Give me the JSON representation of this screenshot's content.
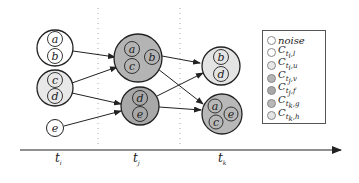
{
  "diagram": {
    "type": "cluster-evolution-timeline",
    "colors": {
      "noise": "#ffffff",
      "C_ti_l": "#ffffff",
      "C_ti_u": "#e8e8e8",
      "C_tj_v": "#b4b4b4",
      "C_tj_f": "#a8a8a8",
      "C_tk_g": "#b8b8b8",
      "C_tk_h": "#e4e4e4",
      "stroke": "#222222",
      "divider": "#aaaaaa"
    },
    "timeline": {
      "labels": [
        {
          "main": "t",
          "sub": "i"
        },
        {
          "main": "t",
          "sub": "j"
        },
        {
          "main": "t",
          "sub": "k"
        }
      ]
    },
    "clusters": [
      {
        "id": "ti-ab",
        "time": "t_i",
        "members": [
          "a",
          "b"
        ],
        "legend": "C_ti_l"
      },
      {
        "id": "ti-cd",
        "time": "t_i",
        "members": [
          "c",
          "d"
        ],
        "legend": "C_ti_u"
      },
      {
        "id": "ti-e",
        "time": "t_i",
        "members": [
          "e"
        ],
        "legend": "noise"
      },
      {
        "id": "tj-abc",
        "time": "t_j",
        "members": [
          "a",
          "b",
          "c"
        ],
        "legend": "C_tj_v"
      },
      {
        "id": "tj-de",
        "time": "t_j",
        "members": [
          "d",
          "e"
        ],
        "legend": "C_tj_f"
      },
      {
        "id": "tk-bd",
        "time": "t_k",
        "members": [
          "b",
          "d"
        ],
        "legend": "C_tk_h"
      },
      {
        "id": "tk-ace",
        "time": "t_k",
        "members": [
          "a",
          "c",
          "e"
        ],
        "legend": "C_tk_g"
      }
    ],
    "edges": [
      {
        "from": "ti-ab",
        "to": "tj-abc"
      },
      {
        "from": "ti-cd",
        "to": "tj-abc"
      },
      {
        "from": "ti-cd",
        "to": "tj-de"
      },
      {
        "from": "ti-e",
        "to": "tj-de"
      },
      {
        "from": "tj-abc",
        "to": "tk-bd"
      },
      {
        "from": "tj-abc",
        "to": "tk-ace"
      },
      {
        "from": "tj-de",
        "to": "tk-bd"
      },
      {
        "from": "tj-de",
        "to": "tk-ace"
      }
    ],
    "legend": {
      "items": [
        {
          "key": "noise",
          "main": "noise",
          "sub": "",
          "sub2": "",
          "color": "#ffffff"
        },
        {
          "key": "C_ti_l",
          "main": "C",
          "sub": "t",
          "subsub": "i",
          "sub2": ",l",
          "color": "#ffffff"
        },
        {
          "key": "C_ti_u",
          "main": "C",
          "sub": "t",
          "subsub": "i",
          "sub2": ",u",
          "color": "#e8e8e8"
        },
        {
          "key": "C_tj_v",
          "main": "C",
          "sub": "t",
          "subsub": "j",
          "sub2": ",v",
          "color": "#b4b4b4"
        },
        {
          "key": "C_tj_f",
          "main": "C",
          "sub": "t",
          "subsub": "j",
          "sub2": ",f",
          "color": "#a8a8a8"
        },
        {
          "key": "C_tk_g",
          "main": "C",
          "sub": "t",
          "subsub": "k",
          "sub2": ",g",
          "color": "#b8b8b8"
        },
        {
          "key": "C_tk_h",
          "main": "C",
          "sub": "t",
          "subsub": "k",
          "sub2": ",h",
          "color": "#e4e4e4"
        }
      ]
    },
    "member_labels": {
      "a": "a",
      "b": "b",
      "c": "c",
      "d": "d",
      "e": "e"
    }
  }
}
